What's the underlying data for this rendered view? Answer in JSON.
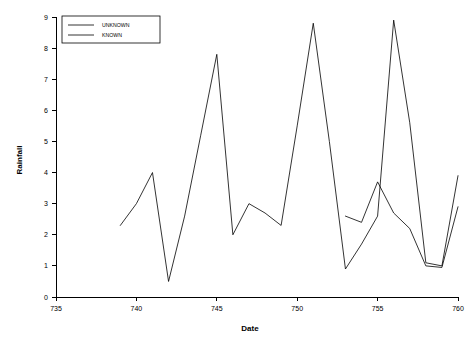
{
  "chart_data": {
    "type": "line",
    "title": "",
    "xlabel": "Date",
    "ylabel": "Rainfall",
    "xlim": [
      735,
      760
    ],
    "ylim": [
      0,
      9
    ],
    "xticks": [
      735,
      740,
      745,
      750,
      755,
      760
    ],
    "yticks": [
      0,
      1,
      2,
      3,
      4,
      5,
      6,
      7,
      8,
      9
    ],
    "grid": false,
    "legend_position": "top-left",
    "series": [
      {
        "name": "UNKNOWN",
        "color": "#000000",
        "x": [
          739,
          740,
          741,
          742,
          743,
          744,
          745,
          746,
          747,
          748,
          749,
          750,
          751,
          752,
          753,
          754,
          755,
          756,
          757,
          758,
          759,
          760
        ],
        "values": [
          2.3,
          3.0,
          4.0,
          0.5,
          2.6,
          5.2,
          7.8,
          2.0,
          3.0,
          2.7,
          2.3,
          5.5,
          8.8,
          5.0,
          0.9,
          1.7,
          2.6,
          8.9,
          5.6,
          1.1,
          1.0,
          3.9
        ]
      },
      {
        "name": "KNOWN",
        "color": "#000000",
        "x": [
          753,
          754,
          755,
          756,
          757,
          758,
          759,
          760
        ],
        "values": [
          2.6,
          2.4,
          3.7,
          2.7,
          2.2,
          1.0,
          0.95,
          2.9
        ]
      }
    ]
  },
  "legend": {
    "entries": [
      {
        "label": "UNKNOWN"
      },
      {
        "label": "KNOWN"
      }
    ]
  },
  "axis_labels": {
    "x_title": "Date",
    "y_title": "Rainfall",
    "x_ticks": [
      "735",
      "740",
      "745",
      "750",
      "755",
      "760"
    ],
    "y_ticks": [
      "0",
      "1",
      "2",
      "3",
      "4",
      "5",
      "6",
      "7",
      "8",
      "9"
    ]
  }
}
